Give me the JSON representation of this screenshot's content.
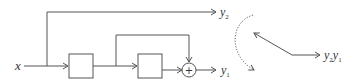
{
  "diagram": {
    "input": {
      "symbol": "x"
    },
    "outputs": {
      "top": {
        "symbol": "y",
        "subscript": "2"
      },
      "bottom": {
        "symbol": "y",
        "subscript": "1"
      }
    },
    "summer": {
      "symbol": "+"
    },
    "blocks": [
      {
        "label": ""
      },
      {
        "label": ""
      }
    ],
    "result": {
      "parts": [
        {
          "symbol": "y",
          "subscript": "2"
        },
        {
          "symbol": "y",
          "subscript": "1"
        }
      ]
    }
  }
}
